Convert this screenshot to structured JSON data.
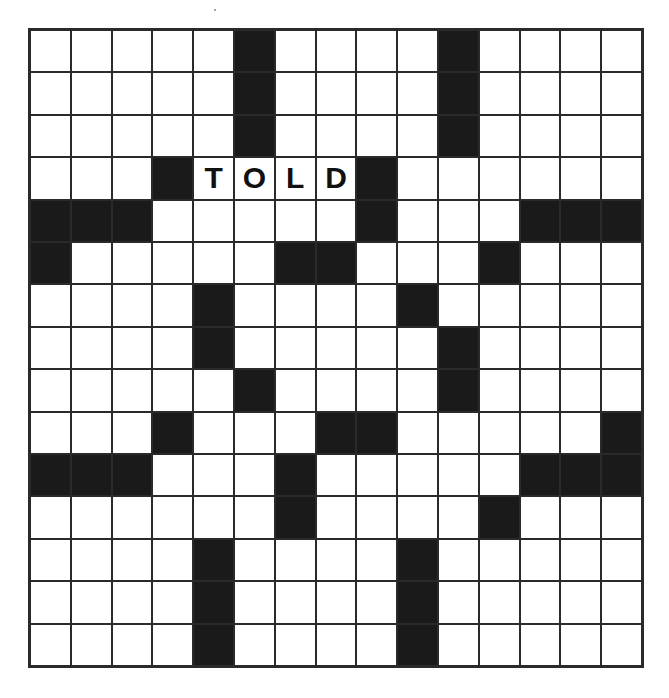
{
  "puzzle": {
    "rows": 15,
    "cols": 15,
    "colors": {
      "black_cell": "#1a1a1a",
      "white_cell": "#ffffff",
      "grid_line": "#2a2a2a",
      "letter": "#111111"
    },
    "layout": [
      "#####.....#....",
      "..........#....",
      "..........#....",
      "...#TOLD#......",
      "###.....#...###",
      "#.....##...#...",
      "....#....#.....",
      "....#.....#....",
      ".....#....#....",
      "...#...##.....#",
      "###...#.....###",
      "......#....#...",
      "....#....#.....",
      "....#....#.....",
      "....#....#....."
    ],
    "black_cells": [
      [
        0,
        5
      ],
      [
        0,
        10
      ],
      [
        1,
        5
      ],
      [
        1,
        10
      ],
      [
        2,
        5
      ],
      [
        2,
        10
      ],
      [
        3,
        3
      ],
      [
        3,
        8
      ],
      [
        4,
        0
      ],
      [
        4,
        1
      ],
      [
        4,
        2
      ],
      [
        4,
        8
      ],
      [
        4,
        12
      ],
      [
        4,
        13
      ],
      [
        4,
        14
      ],
      [
        5,
        0
      ],
      [
        5,
        6
      ],
      [
        5,
        7
      ],
      [
        5,
        11
      ],
      [
        6,
        4
      ],
      [
        6,
        9
      ],
      [
        7,
        4
      ],
      [
        7,
        10
      ],
      [
        8,
        5
      ],
      [
        8,
        10
      ],
      [
        9,
        3
      ],
      [
        9,
        7
      ],
      [
        9,
        8
      ],
      [
        9,
        14
      ],
      [
        10,
        0
      ],
      [
        10,
        1
      ],
      [
        10,
        2
      ],
      [
        10,
        6
      ],
      [
        10,
        12
      ],
      [
        10,
        13
      ],
      [
        10,
        14
      ],
      [
        11,
        6
      ],
      [
        11,
        11
      ],
      [
        12,
        4
      ],
      [
        12,
        9
      ],
      [
        13,
        4
      ],
      [
        13,
        9
      ],
      [
        14,
        4
      ],
      [
        14,
        9
      ]
    ],
    "filled_letters": [
      {
        "row": 3,
        "col": 4,
        "letter": "T"
      },
      {
        "row": 3,
        "col": 5,
        "letter": "O"
      },
      {
        "row": 3,
        "col": 6,
        "letter": "L"
      },
      {
        "row": 3,
        "col": 7,
        "letter": "D"
      }
    ],
    "filled_word": "TOLD"
  }
}
